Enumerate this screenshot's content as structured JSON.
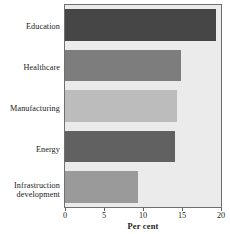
{
  "chart_data": {
    "type": "bar",
    "orientation": "horizontal",
    "title": "",
    "xlabel": "Per cent",
    "ylabel": "",
    "categories": [
      "Education",
      "Healthcare",
      "Manufacturing",
      "Energy",
      "Infrastructure development"
    ],
    "values": [
      19.3,
      14.9,
      14.4,
      14.1,
      9.4
    ],
    "xlim": [
      0,
      20
    ],
    "xticks": [
      0,
      5,
      10,
      15,
      20
    ],
    "xtick_labels": [
      "0",
      "5",
      "10",
      "15",
      "20"
    ],
    "grid": false,
    "legend": "none",
    "bar_colors": [
      "#464646",
      "#7d7d7d",
      "#bcbcbc",
      "#616161",
      "#9a9a9a"
    ],
    "plot_background": "#ebebeb",
    "axis_color": "#6f6f6f"
  },
  "axis": {
    "x_title": "Per cent"
  },
  "labels": {
    "education": "Education",
    "healthcare": "Healthcare",
    "manufacturing": "Manufacturing",
    "energy": "Energy",
    "infrastructure_line1": "Infrastruction",
    "infrastructure_line2": "development"
  }
}
